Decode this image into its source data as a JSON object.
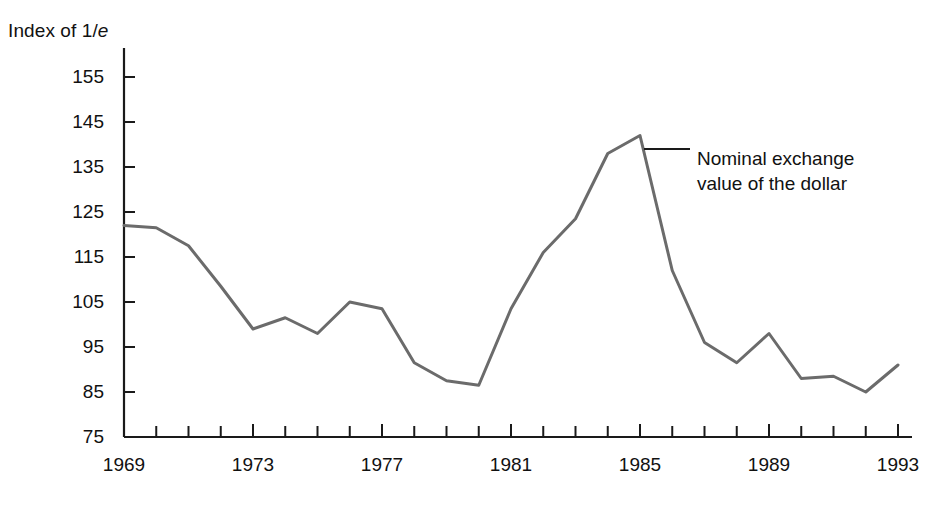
{
  "chart_data": {
    "type": "line",
    "title": "",
    "xlabel": "",
    "ylabel": "Index of 1/e",
    "ylabel_prefix": "Index of 1/",
    "ylabel_italic": "e",
    "x": [
      1969,
      1970,
      1971,
      1972,
      1973,
      1974,
      1975,
      1976,
      1977,
      1978,
      1979,
      1980,
      1981,
      1982,
      1983,
      1984,
      1985,
      1986,
      1987,
      1988,
      1989,
      1990,
      1991,
      1992,
      1993
    ],
    "values": [
      122,
      121.5,
      117.5,
      108.5,
      99,
      101.5,
      98,
      105,
      103.5,
      91.5,
      87.5,
      86.5,
      103.5,
      116,
      123.5,
      138,
      142,
      112,
      96,
      91.5,
      98,
      88,
      88.5,
      85,
      91
    ],
    "series": [
      {
        "name": "Nominal exchange value of the dollar",
        "values": [
          122,
          121.5,
          117.5,
          108.5,
          99,
          101.5,
          98,
          105,
          103.5,
          91.5,
          87.5,
          86.5,
          103.5,
          116,
          123.5,
          138,
          142,
          112,
          96,
          91.5,
          98,
          88,
          88.5,
          85,
          91
        ]
      }
    ],
    "ylim": [
      75,
      160
    ],
    "xlim": [
      1969,
      1993
    ],
    "ytick_labels": [
      "155",
      "145",
      "135",
      "125",
      "115",
      "105",
      "95",
      "85",
      "75"
    ],
    "ytick_values": [
      155,
      145,
      135,
      125,
      115,
      105,
      95,
      85,
      75
    ],
    "xtick_labels": [
      "1969",
      "1973",
      "1977",
      "1981",
      "1985",
      "1989",
      "1993"
    ],
    "xtick_values": [
      1969,
      1973,
      1977,
      1981,
      1985,
      1989,
      1993
    ],
    "xtick_minor_values": [
      1970,
      1971,
      1972,
      1974,
      1975,
      1976,
      1978,
      1979,
      1980,
      1982,
      1983,
      1984,
      1986,
      1987,
      1988,
      1990,
      1991,
      1992
    ],
    "grid": false,
    "legend_position": "none",
    "annotations": [
      {
        "text_line_1": "Nominal exchange",
        "text_line_2": "value of the dollar",
        "target_year": 1985,
        "target_value": 139
      }
    ],
    "colors": {
      "line": "#6b6b6b",
      "axis": "#1a1a1a",
      "annotation_leader": "#1a1a1a",
      "text": "#111111",
      "background": "#ffffff"
    }
  }
}
